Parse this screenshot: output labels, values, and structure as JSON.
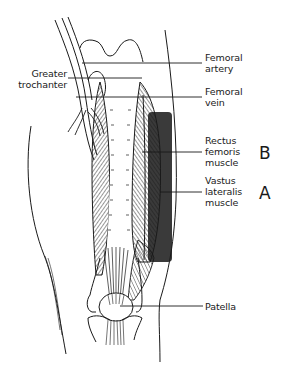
{
  "diagram": {
    "type": "anatomical-illustration",
    "shaded_region_color": "#3a3a3a",
    "line_color": "#1a1a1a",
    "background": "#ffffff"
  },
  "labels": {
    "greater_trochanter": {
      "line1": "Greater",
      "line2": "trochanter"
    },
    "femoral_artery": {
      "line1": "Femoral",
      "line2": "artery"
    },
    "femoral_vein": {
      "line1": "Femoral",
      "line2": "vein"
    },
    "rectus_femoris": {
      "line1": "Rectus",
      "line2": "femoris",
      "line3": "muscle"
    },
    "vastus_lateralis": {
      "line1": "Vastus",
      "line2": "lateralis",
      "line3": "muscle"
    },
    "patella": {
      "line1": "Patella"
    }
  },
  "markers": {
    "b": "B",
    "a": "A"
  }
}
